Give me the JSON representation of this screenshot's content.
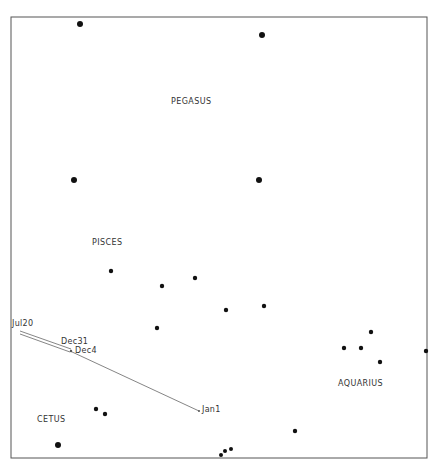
{
  "chart_data": {
    "type": "scatter",
    "title": "",
    "frame": {
      "x0": 11,
      "y0": 17,
      "x1": 427,
      "y1": 458
    },
    "constellations": [
      {
        "name": "PEGASUS",
        "x": 171,
        "y": 102
      },
      {
        "name": "PISCES",
        "x": 92,
        "y": 243
      },
      {
        "name": "AQUARIUS",
        "x": 338,
        "y": 384
      },
      {
        "name": "CETUS",
        "x": 37,
        "y": 420
      }
    ],
    "stars": [
      {
        "x": 80,
        "y": 24,
        "r": 3
      },
      {
        "x": 262,
        "y": 35,
        "r": 3
      },
      {
        "x": 74,
        "y": 180,
        "r": 3
      },
      {
        "x": 259,
        "y": 180,
        "r": 3
      },
      {
        "x": 111,
        "y": 271,
        "r": 2.2
      },
      {
        "x": 195,
        "y": 278,
        "r": 2.2
      },
      {
        "x": 162,
        "y": 286,
        "r": 2.2
      },
      {
        "x": 264,
        "y": 306,
        "r": 2.2
      },
      {
        "x": 226,
        "y": 310,
        "r": 2.2
      },
      {
        "x": 157,
        "y": 328,
        "r": 2.2
      },
      {
        "x": 371,
        "y": 332,
        "r": 2.2
      },
      {
        "x": 344,
        "y": 348,
        "r": 2.2
      },
      {
        "x": 361,
        "y": 348,
        "r": 2.2
      },
      {
        "x": 426,
        "y": 351,
        "r": 2.2
      },
      {
        "x": 380,
        "y": 362,
        "r": 2.2
      },
      {
        "x": 96,
        "y": 409,
        "r": 2.2
      },
      {
        "x": 105,
        "y": 414,
        "r": 2.2
      },
      {
        "x": 295,
        "y": 431,
        "r": 2.2
      },
      {
        "x": 58,
        "y": 445,
        "r": 3
      },
      {
        "x": 231,
        "y": 449,
        "r": 2
      },
      {
        "x": 225,
        "y": 451,
        "r": 2
      },
      {
        "x": 221,
        "y": 455,
        "r": 2
      }
    ],
    "path": {
      "points": [
        {
          "label": "Jul20",
          "x": 20,
          "y": 332
        },
        {
          "label": "Dec31",
          "x": 71,
          "y": 349
        },
        {
          "label": "Dec4",
          "x": 70,
          "y": 351
        },
        {
          "label": "Jan1",
          "x": 199,
          "y": 411
        }
      ]
    },
    "path_labels": [
      {
        "text": "Jul20",
        "x": 12,
        "y": 320
      },
      {
        "text": "Dec31",
        "x": 61,
        "y": 338
      },
      {
        "text": "Dec4",
        "x": 75,
        "y": 347
      },
      {
        "text": "Jan1",
        "x": 202,
        "y": 407
      }
    ]
  }
}
